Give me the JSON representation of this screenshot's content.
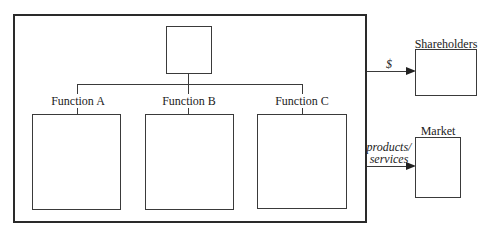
{
  "diagram": {
    "type": "organizational-structure",
    "top_box_label": "",
    "functions": [
      {
        "label": "Function A"
      },
      {
        "label": "Function B"
      },
      {
        "label": "Function C"
      }
    ],
    "external": {
      "shareholders": {
        "label": "Shareholders",
        "flow_label": "$"
      },
      "market": {
        "label": "Market",
        "flow_label_line1": "products/",
        "flow_label_line2": "services"
      }
    }
  }
}
